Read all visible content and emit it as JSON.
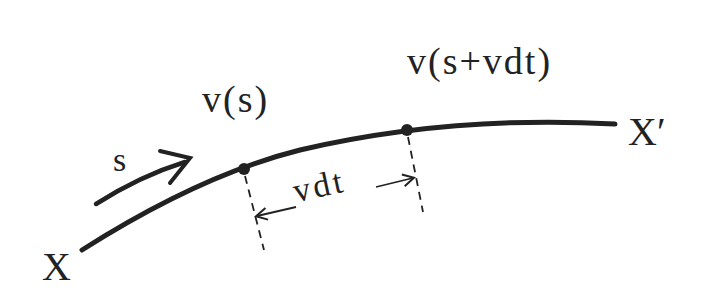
{
  "diagram": {
    "type": "curve-with-points",
    "labels": {
      "start": "X",
      "end": "X′",
      "arc_param": "s",
      "point1": "v(s)",
      "point2": "v(s+vdt)",
      "interval": "vdt"
    },
    "colors": {
      "stroke": "#222222",
      "background": "#ffffff"
    }
  }
}
